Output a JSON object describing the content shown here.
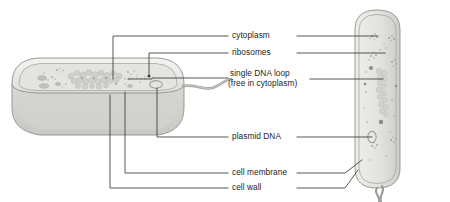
{
  "figure": {
    "type": "biology-diagram",
    "background_color": "#ffffff",
    "line_color": "#3a3a3a",
    "cell_fill": "#dcdcd8",
    "cell_fill_light": "#e9e9e6",
    "cell_outline": "#8e8e8a",
    "organelle_color": "#9a9a96"
  },
  "labels": {
    "cytoplasm": "cytoplasm",
    "ribosomes": "ribosomes",
    "dna_loop_line1": "single DNA loop",
    "dna_loop_line2": "(free in cytoplasm)",
    "plasmid": "plasmid DNA",
    "cell_membrane": "cell membrane",
    "cell_wall": "cell wall"
  },
  "cells": {
    "left": {
      "name": "cut-away bacterium",
      "orientation": "horizontal",
      "has_flagellum": true
    },
    "right": {
      "name": "whole bacterium",
      "orientation": "vertical",
      "has_flagellum": true
    }
  }
}
